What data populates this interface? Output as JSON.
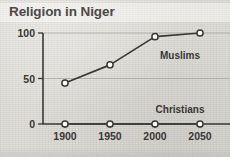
{
  "chart_data": {
    "type": "line",
    "title": "Religion in Niger",
    "xlabel": "",
    "ylabel": "",
    "x": [
      1900,
      1950,
      2000,
      2050
    ],
    "categories": [
      "1900",
      "1950",
      "2000",
      "2050"
    ],
    "series": [
      {
        "name": "Muslims",
        "values": [
          45,
          65,
          96,
          100
        ]
      },
      {
        "name": "Christians",
        "values": [
          0,
          0,
          0,
          0
        ]
      }
    ],
    "ylim": [
      0,
      100
    ],
    "yticks": [
      0,
      50,
      100
    ],
    "ytick_labels": [
      "0",
      "50",
      "100"
    ],
    "xlim": [
      1900,
      2050
    ],
    "grid": true,
    "legend": "inline-labels",
    "annotations": [
      {
        "text": "Muslims",
        "series": "Muslims"
      },
      {
        "text": "Christians",
        "series": "Christians"
      }
    ],
    "colors": {
      "line": "#3a3836",
      "marker_fill": "#ffffff",
      "grid": "#a9a6a0",
      "axis": "#3a3836",
      "text": "#3a3836",
      "title_text": "#4c4a48",
      "background": "#dcdad5"
    }
  }
}
